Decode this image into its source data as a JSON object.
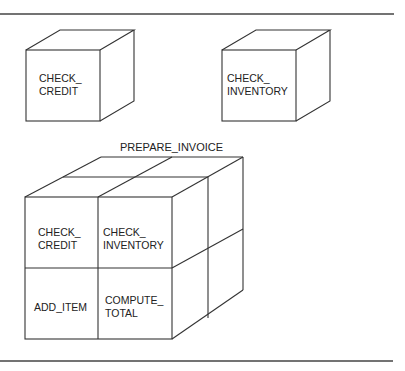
{
  "diagram": {
    "standalone_modules": [
      {
        "id": "check_credit",
        "lines": [
          "CHECK_",
          "CREDIT"
        ]
      },
      {
        "id": "check_inventory",
        "lines": [
          "CHECK_",
          "INVENTORY"
        ]
      }
    ],
    "composite": {
      "title": "PREPARE_INVOICE",
      "cells": [
        {
          "position": "top-left",
          "lines": [
            "CHECK_",
            "CREDIT"
          ]
        },
        {
          "position": "top-right",
          "lines": [
            "CHECK_",
            "INVENTORY"
          ]
        },
        {
          "position": "bottom-left",
          "lines": [
            "ADD_ITEM"
          ]
        },
        {
          "position": "bottom-right",
          "lines": [
            "COMPUTE_",
            "TOTAL"
          ]
        }
      ]
    },
    "colors": {
      "line": "#333333",
      "text": "#222222",
      "background": "#ffffff"
    }
  }
}
